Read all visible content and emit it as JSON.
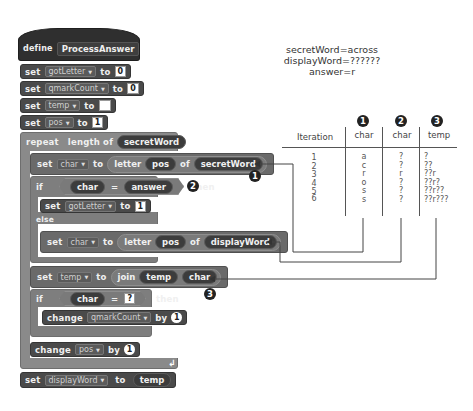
{
  "script": {
    "define": {
      "keyword": "define",
      "name": "ProcessAnswer"
    },
    "init": [
      {
        "keyword": "set",
        "var": "gotLetter",
        "to": "to",
        "value": "0"
      },
      {
        "keyword": "set",
        "var": "qmarkCount",
        "to": "to",
        "value": "0"
      },
      {
        "keyword": "set",
        "var": "temp",
        "to": "to",
        "value": ""
      },
      {
        "keyword": "set",
        "var": "pos",
        "to": "to",
        "value": "1"
      }
    ],
    "repeat": {
      "keyword": "repeat",
      "op": "length of",
      "arg": "secretWord"
    },
    "set_char_secret": {
      "keyword": "set",
      "var": "char",
      "to": "to",
      "op": "letter",
      "idx": "pos",
      "of": "of",
      "src": "secretWord"
    },
    "if1": {
      "keyword": "if",
      "left": "char",
      "op": "=",
      "right": "answer",
      "then": "then"
    },
    "set_got": {
      "keyword": "set",
      "var": "gotLetter",
      "to": "to",
      "value": "1"
    },
    "else": "else",
    "set_char_display": {
      "keyword": "set",
      "var": "char",
      "to": "to",
      "op": "letter",
      "idx": "pos",
      "of": "of",
      "src": "displayWord"
    },
    "set_temp": {
      "keyword": "set",
      "var": "temp",
      "to": "to",
      "op": "join",
      "a": "temp",
      "b": "char"
    },
    "if2": {
      "keyword": "if",
      "left": "char",
      "op": "=",
      "right": "?",
      "then": "then"
    },
    "change_qmark": {
      "keyword": "change",
      "var": "qmarkCount",
      "by": "by",
      "value": "1"
    },
    "change_pos": {
      "keyword": "change",
      "var": "pos",
      "by": "by",
      "value": "1"
    },
    "repeat_end_icon": "loop-arrow-icon",
    "set_display": {
      "keyword": "set",
      "var": "displayWord",
      "to": "to",
      "value": "temp"
    }
  },
  "annotations": {
    "badge1": "1",
    "badge2": "2",
    "badge3": "3"
  },
  "info": {
    "line1": "secretWord=across",
    "line2": "displayWord=??????",
    "line3": "answer=r"
  },
  "table": {
    "badges": [
      "1",
      "2",
      "3"
    ],
    "headers": [
      "Iteration",
      "char",
      "char",
      "temp"
    ],
    "rows": [
      {
        "iteration": "1",
        "char1": "a",
        "char2": "?",
        "temp": "?"
      },
      {
        "iteration": "2",
        "char1": "c",
        "char2": "?",
        "temp": "??"
      },
      {
        "iteration": "3",
        "char1": "r",
        "char2": "r",
        "temp": "??r"
      },
      {
        "iteration": "4",
        "char1": "o",
        "char2": "?",
        "temp": "??r?"
      },
      {
        "iteration": "5",
        "char1": "s",
        "char2": "?",
        "temp": "??r??"
      },
      {
        "iteration": "6",
        "char1": "s",
        "char2": "?",
        "temp": "??r???"
      }
    ]
  }
}
